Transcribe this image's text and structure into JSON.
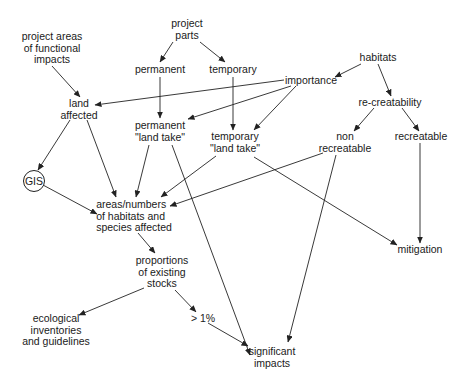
{
  "diagram": {
    "nodes": {
      "project_parts": "project\nparts",
      "project_areas": "project areas\nof functional\nimpacts",
      "permanent": "permanent",
      "temporary": "temporary",
      "habitats": "habitats",
      "importance": "importance",
      "land_affected": "land\naffected",
      "re_creatability": "re-creatability",
      "permanent_land_take": "permanent\n\"land take\"",
      "temporary_land_take": "temporary\n\"land take\"",
      "non_recreatable": "non\nrecreatable",
      "recreatable": "recreatable",
      "gis": "GIS",
      "areas_numbers": "areas/numbers\nof habitats and\nspecies affected",
      "mitigation": "mitigation",
      "proportions": "proportions\nof existing\nstocks",
      "ecological": "ecological\ninventories\nand guidelines",
      "gt1": "> 1%",
      "significant_impacts": "significant\nimpacts"
    },
    "edges": [
      [
        "project_parts",
        "permanent"
      ],
      [
        "project_parts",
        "temporary"
      ],
      [
        "project_areas",
        "land_affected"
      ],
      [
        "habitats",
        "importance"
      ],
      [
        "habitats",
        "re_creatability"
      ],
      [
        "importance",
        "land_affected"
      ],
      [
        "importance",
        "permanent_land_take"
      ],
      [
        "importance",
        "temporary_land_take"
      ],
      [
        "permanent",
        "permanent_land_take"
      ],
      [
        "temporary",
        "temporary_land_take"
      ],
      [
        "re_creatability",
        "non_recreatable"
      ],
      [
        "re_creatability",
        "recreatable"
      ],
      [
        "land_affected",
        "gis"
      ],
      [
        "land_affected",
        "areas_numbers"
      ],
      [
        "gis",
        "areas_numbers"
      ],
      [
        "permanent_land_take",
        "areas_numbers"
      ],
      [
        "permanent_land_take",
        "significant_impacts"
      ],
      [
        "temporary_land_take",
        "areas_numbers"
      ],
      [
        "temporary_land_take",
        "mitigation"
      ],
      [
        "non_recreatable",
        "areas_numbers"
      ],
      [
        "non_recreatable",
        "significant_impacts"
      ],
      [
        "recreatable",
        "mitigation"
      ],
      [
        "areas_numbers",
        "proportions"
      ],
      [
        "proportions",
        "ecological"
      ],
      [
        "proportions",
        "gt1"
      ],
      [
        "gt1",
        "significant_impacts"
      ]
    ]
  }
}
